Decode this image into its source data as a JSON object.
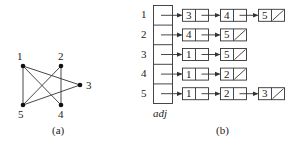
{
  "graph": {
    "caption": "(a)",
    "nodes": [
      {
        "id": "1",
        "x": 23,
        "y": 66,
        "lx": 17,
        "ly": 51
      },
      {
        "id": "2",
        "x": 61,
        "y": 66,
        "lx": 58,
        "ly": 51
      },
      {
        "id": "3",
        "x": 80,
        "y": 85,
        "lx": 86,
        "ly": 80
      },
      {
        "id": "4",
        "x": 61,
        "y": 105,
        "lx": 58,
        "ly": 109
      },
      {
        "id": "5",
        "x": 23,
        "y": 105,
        "lx": 18,
        "ly": 109
      }
    ],
    "edges": [
      [
        "1",
        "3"
      ],
      [
        "1",
        "4"
      ],
      [
        "1",
        "5"
      ],
      [
        "2",
        "4"
      ],
      [
        "2",
        "5"
      ],
      [
        "3",
        "5"
      ]
    ]
  },
  "adjacency_list": {
    "caption": "(b)",
    "array_label": "adj",
    "rows": [
      {
        "index": "1",
        "list": [
          "3",
          "4",
          "5"
        ]
      },
      {
        "index": "2",
        "list": [
          "4",
          "5"
        ]
      },
      {
        "index": "3",
        "list": [
          "1",
          "5"
        ]
      },
      {
        "index": "4",
        "list": [
          "1",
          "2"
        ]
      },
      {
        "index": "5",
        "list": [
          "1",
          "2",
          "3"
        ]
      }
    ]
  },
  "colors": {
    "line": "#333333",
    "text": "#222222",
    "background": "#ffffff"
  }
}
